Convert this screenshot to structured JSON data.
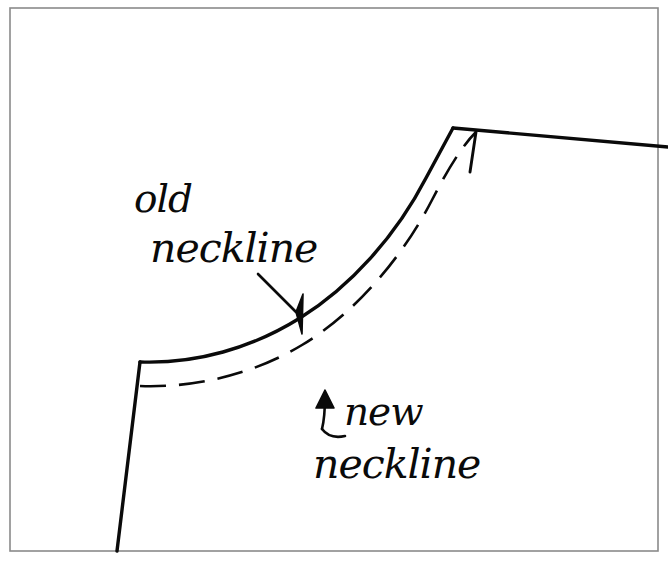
{
  "document": {
    "kind": "hand-drawn-sewing-pattern-sketch",
    "title": "Neckline alteration sketch",
    "background_color": "#ffffff",
    "ink_color": "#0a0a0a",
    "border_color": "#8a8a8a"
  },
  "annotations": {
    "old_neckline": {
      "line1": "old",
      "line2": "neckline",
      "arrow": "diagonal-arrow-down-right",
      "points_to": "solid-neckline-curve"
    },
    "new_neckline": {
      "line1": "new",
      "line2": "neckline",
      "arrow": "hook-arrow-up",
      "points_to": "dashed-neckline-curve"
    }
  },
  "drawing": {
    "frame": {
      "x": 10,
      "y": 8,
      "width": 648,
      "height": 543
    },
    "solid_neckline_path": "M 140 362 C 196 364 252 348 300 318 C 350 287 396 236 426 178 C 438 156 447 139 453 128",
    "shoulder_line_path": "M 453 128 L 668 147",
    "center_front_line_path": "M 140 362 L 117 551",
    "dashed_neckline_path": "M 140 386 C 196 388 254 374 302 345 C 352 315 400 262 432 200 C 448 169 462 146 476 132",
    "dashed_shoulder_tick_path": "M 476 132 L 470 172",
    "old_arrow_shaft": "M 258 274 L 296 312",
    "old_arrow_head": "M 296 312 L 303 294 L 302 334 Z",
    "new_arrow_shaft": "M 322 429 C 325 417 325 408 325 396",
    "new_arrow_head": "M 325 390 L 316 408 L 334 408 Z",
    "new_arrow_tail": "M 322 429 C 328 437 336 438 345 436"
  },
  "text_positions": {
    "old_line1_x": 134,
    "old_line1_y": 212,
    "old_line2_x": 150,
    "old_line2_y": 262,
    "new_line1_x": 344,
    "new_line1_y": 425,
    "new_line2_x": 313,
    "new_line2_y": 478
  }
}
